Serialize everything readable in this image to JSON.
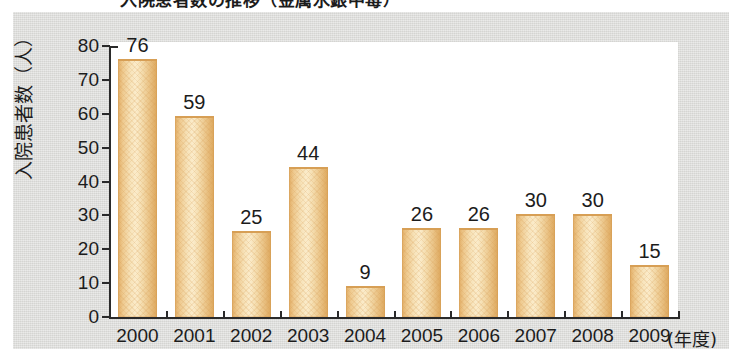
{
  "title": "入院患者数の推移（金属水銀中毒）",
  "chart_data": {
    "type": "bar",
    "title": "入院患者数の推移（金属水銀中毒）",
    "xlabel": "(年度)",
    "ylabel": "入院患者数（人）",
    "categories": [
      "2000",
      "2001",
      "2002",
      "2003",
      "2004",
      "2005",
      "2006",
      "2007",
      "2008",
      "2009"
    ],
    "values": [
      76,
      59,
      25,
      44,
      9,
      26,
      26,
      30,
      30,
      15
    ],
    "ylim": [
      0,
      80
    ],
    "yticks": [
      0,
      10,
      20,
      30,
      40,
      50,
      60,
      70,
      80
    ],
    "ytick_labels": [
      "0",
      "10",
      "20",
      "30",
      "40",
      "50",
      "60",
      "70",
      "80"
    ],
    "grid": false,
    "legend": null,
    "bar_color": "#f0cd93",
    "bar_edge_color": "#dda75c",
    "axis_color": "#2a2a2a",
    "plot_background": "#ffffff",
    "panel_background": "#d9d9d6",
    "text_color": "#1c1c1c"
  }
}
